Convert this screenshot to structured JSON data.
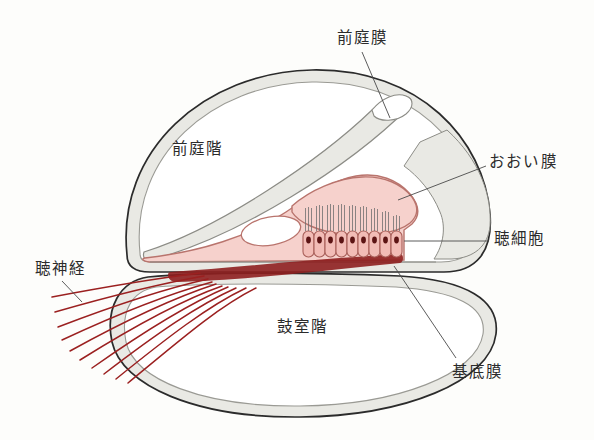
{
  "figure": {
    "background_color": "#fdfdfb"
  },
  "colors": {
    "background": "#fdfdfb",
    "outline": "#2b2b2b",
    "bone_fill": "#e9e9e4",
    "bone_stroke": "#8c8c86",
    "organ_pink_fill": "#f6d1cc",
    "organ_pink_stroke": "#b9746d",
    "hair_cell_fill": "#f2bcb6",
    "hair_cell_stroke": "#a85f59",
    "nucleus": "#5c1414",
    "nerve_fiber": "#9b2020",
    "nerve_band": "#8e1f1f",
    "leader_line": "#4a4a4a",
    "text": "#2b2b2b"
  },
  "labels": {
    "vestibular_membrane": "前庭膜",
    "tectorial_membrane": "おおい膜",
    "hair_cells": "聴細胞",
    "basilar_membrane": "基底膜",
    "auditory_nerve": "聴神経",
    "scala_vestibuli": "前庭階",
    "scala_tympani": "鼓室階"
  },
  "structures": {
    "hair_cell_count": 9,
    "stereocilia_per_cell": 3,
    "nerve_fiber_count": 10
  }
}
